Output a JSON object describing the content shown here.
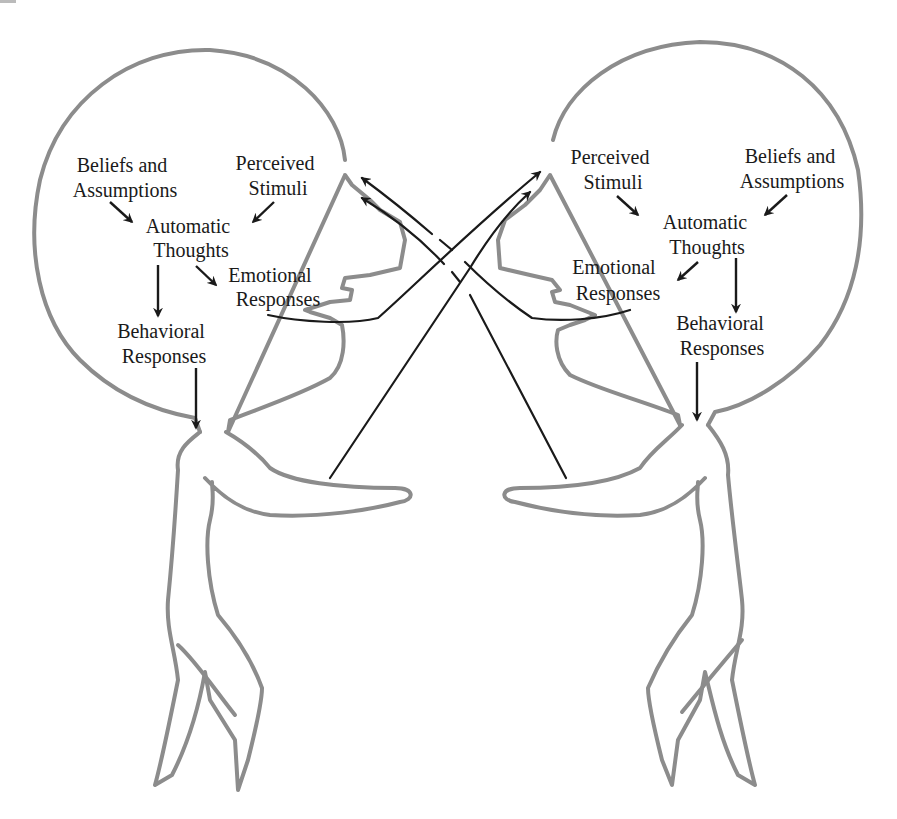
{
  "diagram": {
    "left_person": {
      "beliefs_line1": "Beliefs and",
      "beliefs_line2": "Assumptions",
      "stimuli_line1": "Perceived",
      "stimuli_line2": "Stimuli",
      "thoughts_line1": "Automatic",
      "thoughts_line2": "Thoughts",
      "emotional_line1": "Emotional",
      "emotional_line2": "Responses",
      "behavioral_line1": "Behavioral",
      "behavioral_line2": "Responses"
    },
    "right_person": {
      "beliefs_line1": "Beliefs and",
      "beliefs_line2": "Assumptions",
      "stimuli_line1": "Perceived",
      "stimuli_line2": "Stimuli",
      "thoughts_line1": "Automatic",
      "thoughts_line2": "Thoughts",
      "emotional_line1": "Emotional",
      "emotional_line2": "Responses",
      "behavioral_line1": "Behavioral",
      "behavioral_line2": "Responses"
    },
    "edges": [
      {
        "from": "Beliefs and Assumptions",
        "to": "Automatic Thoughts"
      },
      {
        "from": "Perceived Stimuli",
        "to": "Automatic Thoughts"
      },
      {
        "from": "Automatic Thoughts",
        "to": "Emotional Responses"
      },
      {
        "from": "Automatic Thoughts",
        "to": "Behavioral Responses"
      },
      {
        "from": "Behavioral Responses",
        "to": "Body"
      },
      {
        "from": "Left Emotional Responses / mouth",
        "to": "Right Perceived Stimuli"
      },
      {
        "from": "Left hand",
        "to": "Right Perceived Stimuli"
      },
      {
        "from": "Right Emotional Responses / mouth",
        "to": "Left Perceived Stimuli"
      },
      {
        "from": "Right hand",
        "to": "Left Perceived Stimuli"
      }
    ],
    "colors": {
      "outline": "#8c8c8c",
      "ink": "#1a1a1a",
      "background": "#ffffff"
    }
  }
}
